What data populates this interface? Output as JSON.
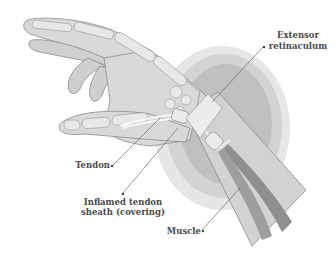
{
  "diagram": {
    "colors": {
      "background": "#ffffff",
      "skin": "#d9d9d9",
      "skin_outline": "#8c8c8c",
      "bone": "#e6e6e6",
      "bone_outline": "#9a9a9a",
      "inflammation_outer": "#e3e3e3",
      "inflammation_mid": "#cdcdcd",
      "inflammation_inner": "#b8b8b8",
      "retinaculum": "#efefef",
      "muscle": "#8a8a8a",
      "tendon": "#f7f7f7",
      "label_text": "#4a4a4a",
      "leader_line": "#555555"
    },
    "labels": {
      "extensor_line1": "Extensor",
      "extensor_line2": "retinaculum",
      "tendon": "Tendon",
      "sheath_line1": "Inflamed tendon",
      "sheath_line2": "sheath (covering)",
      "muscle": "Muscle"
    }
  }
}
